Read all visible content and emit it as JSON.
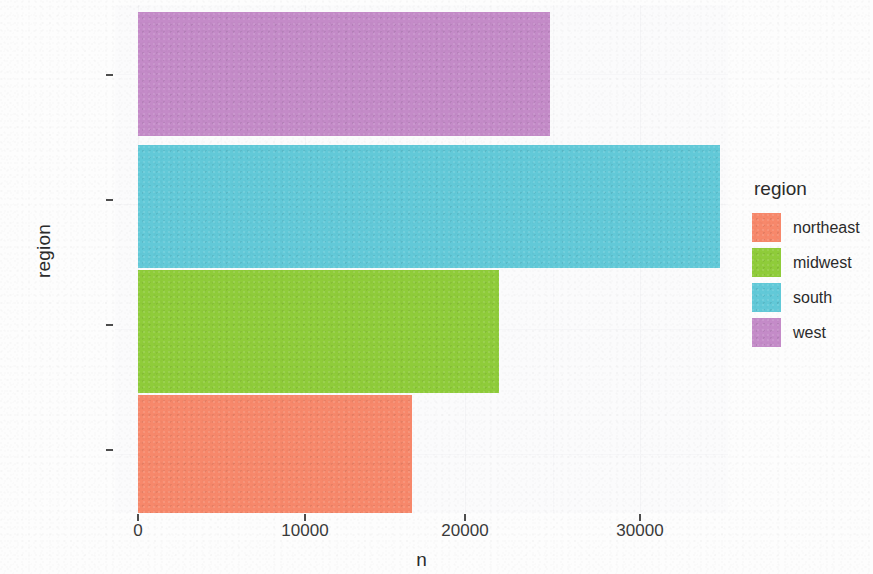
{
  "chart_data": {
    "type": "bar",
    "orientation": "horizontal",
    "title": "",
    "xlabel": "n",
    "ylabel": "region",
    "categories": [
      "northeast",
      "midwest",
      "south",
      "west"
    ],
    "category_order_top_to_bottom": [
      "west",
      "south",
      "midwest",
      "northeast"
    ],
    "values": [
      15800,
      20800,
      33500,
      23700
    ],
    "series": [
      {
        "name": "n",
        "values": [
          15800,
          20800,
          33500,
          23700
        ]
      }
    ],
    "bars": [
      {
        "category": "northeast",
        "value": 15800,
        "color": "#F7886B"
      },
      {
        "category": "midwest",
        "value": 20800,
        "color": "#8FCC3A"
      },
      {
        "category": "south",
        "value": 33500,
        "color": "#62C9D8"
      },
      {
        "category": "west",
        "value": 23700,
        "color": "#C48BC8"
      }
    ],
    "xlim": [
      0,
      33800
    ],
    "x_ticks": [
      0,
      10000,
      20000,
      30000
    ],
    "x_tick_labels": [
      "0",
      "10000",
      "20000",
      "30000"
    ],
    "y_ticks": [
      "northeast",
      "midwest",
      "south",
      "west"
    ],
    "grid": true,
    "grid_axis": "x",
    "legend": {
      "title": "region",
      "position": "right",
      "entries": [
        {
          "label": "northeast",
          "color": "#F7886B"
        },
        {
          "label": "midwest",
          "color": "#8FCC3A"
        },
        {
          "label": "south",
          "color": "#62C9D8"
        },
        {
          "label": "west",
          "color": "#C48BC8"
        }
      ]
    },
    "colors": {
      "northeast": "#F7886B",
      "midwest": "#8FCC3A",
      "south": "#62C9D8",
      "west": "#C48BC8",
      "panel_background": "#FBFBFC",
      "grid": "#F4F4F6",
      "text": "#2B2B2B"
    }
  },
  "axes": {
    "x_title": "n",
    "y_title": "region"
  },
  "x_tick_labels": {
    "t0": "0",
    "t1": "10000",
    "t2": "20000",
    "t3": "30000"
  },
  "y_tick_labels": {
    "t0": "west",
    "t1": "south",
    "t2": "midwest",
    "t3": "northeast"
  },
  "legend": {
    "title": "region",
    "item0": "northeast",
    "item1": "midwest",
    "item2": "south",
    "item3": "west"
  }
}
